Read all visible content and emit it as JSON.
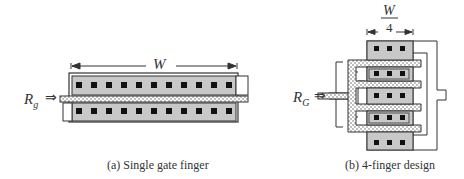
{
  "figure_a": {
    "caption": "(a)  Single gate finger",
    "width_label": "W",
    "input_label_main": "R",
    "input_label_sub": "g",
    "arrow": "⇒",
    "contacts_per_row": 14
  },
  "figure_b": {
    "caption": "(b) 4-finger design",
    "width_label_num": "W",
    "width_label_den": "4",
    "input_label_main": "R",
    "input_label_sub": "G",
    "arrow": "⇒",
    "fingers": 4,
    "contacts_per_row": 3
  },
  "colors": {
    "diffusion": "#c8c8c8",
    "contact": "#111111",
    "outline": "#333333",
    "gate_fill": "#ffffff"
  }
}
